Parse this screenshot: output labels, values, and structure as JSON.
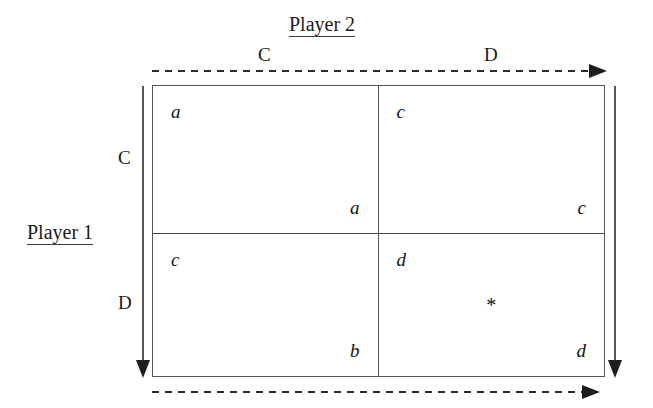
{
  "figure": {
    "type": "payoff-matrix",
    "players": {
      "row_player": "Player 1",
      "column_player": "Player 2"
    },
    "strategies": {
      "row": [
        "C",
        "D"
      ],
      "column": [
        "C",
        "D"
      ]
    },
    "cells": [
      {
        "id": "cc",
        "row_strategy": "C",
        "column_strategy": "C",
        "row_payoff": "a",
        "column_payoff": "a",
        "marker": ""
      },
      {
        "id": "cd",
        "row_strategy": "C",
        "column_strategy": "D",
        "row_payoff": "c",
        "column_payoff": "c",
        "marker": ""
      },
      {
        "id": "dc",
        "row_strategy": "D",
        "column_strategy": "C",
        "row_payoff": "c",
        "column_payoff": "b",
        "marker": ""
      },
      {
        "id": "dd",
        "row_strategy": "D",
        "column_strategy": "D",
        "row_payoff": "d",
        "column_payoff": "d",
        "marker": "*"
      }
    ],
    "arrows": {
      "top": "dashed-right",
      "bottom": "dashed-right",
      "left": "solid-down",
      "right": "solid-down"
    },
    "colors": {
      "ink": "#121212",
      "rule": "#555555",
      "arrow": "#2b2b2b",
      "background": "#ffffff"
    }
  }
}
